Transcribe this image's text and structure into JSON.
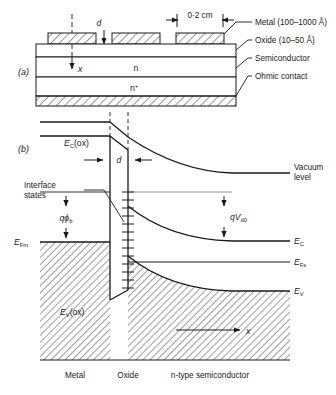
{
  "figure": {
    "panel_a": {
      "label": "(a)",
      "dim_gap": "d",
      "dim_width": "0·2 cm",
      "depth_axis": "x",
      "layer_n": "n",
      "layer_nplus": "n",
      "layer_nplus_sup": "+",
      "callouts": [
        "Metal (100–1000 Å)",
        "Oxide (10–50 Å)",
        "Semiconductor",
        "Ohmic contact"
      ]
    },
    "panel_b": {
      "label": "(b)",
      "oxide_conduction": "E",
      "oxide_conduction_sub": "C",
      "oxide_conduction_tail": "(ox)",
      "oxide_valence": "E",
      "oxide_valence_sub": "V",
      "oxide_valence_tail": "(ox)",
      "vacuum_line1": "Vacuum",
      "vacuum_line2": "level",
      "dim_gap": "d",
      "interface_line1": "Interface",
      "interface_line2": "states",
      "barrier_q": "q",
      "barrier_phi": "ϕ",
      "barrier_sub": "b",
      "diffusion_q": "q",
      "diffusion_v": "V",
      "diffusion_sub": "d0",
      "fermi_metal": "E",
      "fermi_metal_sub": "Fm",
      "fermi_semi": "E",
      "fermi_semi_sub": "Fs",
      "cond_band": "E",
      "cond_band_sub": "C",
      "val_band": "E",
      "val_band_sub": "V",
      "depth_axis": "x",
      "region_metal": "Metal",
      "region_oxide": "Oxide",
      "region_semiconductor": "n-type semiconductor"
    },
    "colors": {
      "line": "#1a1a1a",
      "hatch": "#1a1a1a",
      "background": "#ffffff"
    }
  }
}
